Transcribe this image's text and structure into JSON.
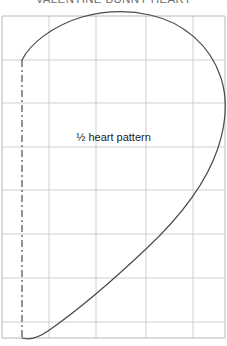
{
  "document": {
    "title": "VALENTINE BUNNY HEART",
    "pattern_label": "½ heart pattern"
  },
  "colors": {
    "background": "#ffffff",
    "title_text": "#6e6e6e",
    "label_text": "#1b1b1b",
    "grid_line": "#c9c9c9",
    "grid_border": "#b8b8b8",
    "outline_curve": "#4a4a4a",
    "fold_line": "#3d3d3d"
  },
  "grid": {
    "left": 2,
    "right": 225,
    "top": 16,
    "bottom": 338,
    "vertical_lines": [
      2,
      49,
      96,
      146,
      193,
      225
    ],
    "horizontal_lines": [
      16,
      60,
      103,
      147,
      190,
      234,
      278,
      322,
      338
    ],
    "cell_width": 47,
    "cell_height": 44
  },
  "fold_line": {
    "name": "fold-line",
    "style": "dash-dot",
    "x": 22,
    "y_start": 60,
    "y_end": 338,
    "dash_array": "7 3 2 3",
    "stroke_width": 1.1
  },
  "heart_curve": {
    "name": "half-heart-outline",
    "stroke_width": 1.2,
    "start": [
      22,
      60
    ],
    "apex": [
      134,
      12
    ],
    "right_extreme": [
      225,
      116
    ],
    "end": [
      22,
      338
    ],
    "path": "M 22 60 C 30 44 52 26 82 17 C 104 11 128 10 150 15 C 182 22 210 44 221 78 C 228 100 226 124 218 148 C 206 184 178 219 146 249 C 110 283 74 313 48 331 C 38 338 29 340 22 338"
  },
  "chart_data": {
    "type": "line",
    "title": "VALENTINE BUNNY HEART",
    "xlabel": "",
    "ylabel": "",
    "annotations": [
      "½ heart pattern"
    ],
    "xlim": [
      2,
      225
    ],
    "ylim": [
      16,
      338
    ],
    "grid": true,
    "legend": "none",
    "series": [
      {
        "name": "half-heart-outline",
        "x": [
          22,
          54,
          90,
          128,
          163,
          194,
          216,
          224,
          221,
          208,
          187,
          160,
          128,
          96,
          66,
          42,
          28,
          22
        ],
        "y": [
          60,
          31,
          17,
          12,
          18,
          36,
          62,
          90,
          116,
          144,
          174,
          206,
          236,
          265,
          292,
          315,
          330,
          338
        ]
      },
      {
        "name": "fold-line",
        "x": [
          22,
          22
        ],
        "y": [
          60,
          338
        ]
      }
    ]
  }
}
